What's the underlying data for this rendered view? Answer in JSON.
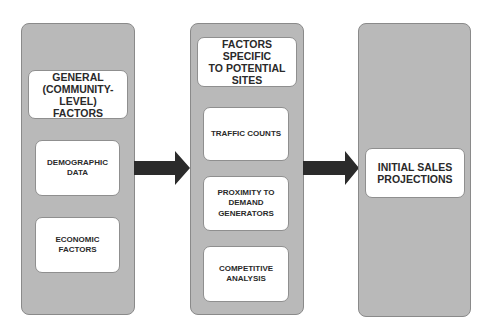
{
  "diagram": {
    "colors": {
      "panel_fill": "#b9b9b9",
      "box_fill": "#ffffff",
      "arrow": "#2b2b2b",
      "text": "#2a2a2a"
    },
    "columns": [
      {
        "header": "GENERAL\n(COMMUNITY-\nLEVEL)\nFACTORS",
        "items": [
          "DEMOGRAPHIC\nDATA",
          "ECONOMIC\nFACTORS"
        ]
      },
      {
        "header": "FACTORS SPECIFIC\nTO POTENTIAL\nSITES",
        "items": [
          "TRAFFIC COUNTS",
          "PROXIMITY TO\nDEMAND\nGENERATORS",
          "COMPETITIVE\nANALYSIS"
        ]
      },
      {
        "header": "INITIAL SALES\nPROJECTIONS",
        "items": []
      }
    ],
    "arrows": [
      {
        "from": "column-1",
        "to": "column-2"
      },
      {
        "from": "column-2",
        "to": "column-3"
      }
    ]
  }
}
